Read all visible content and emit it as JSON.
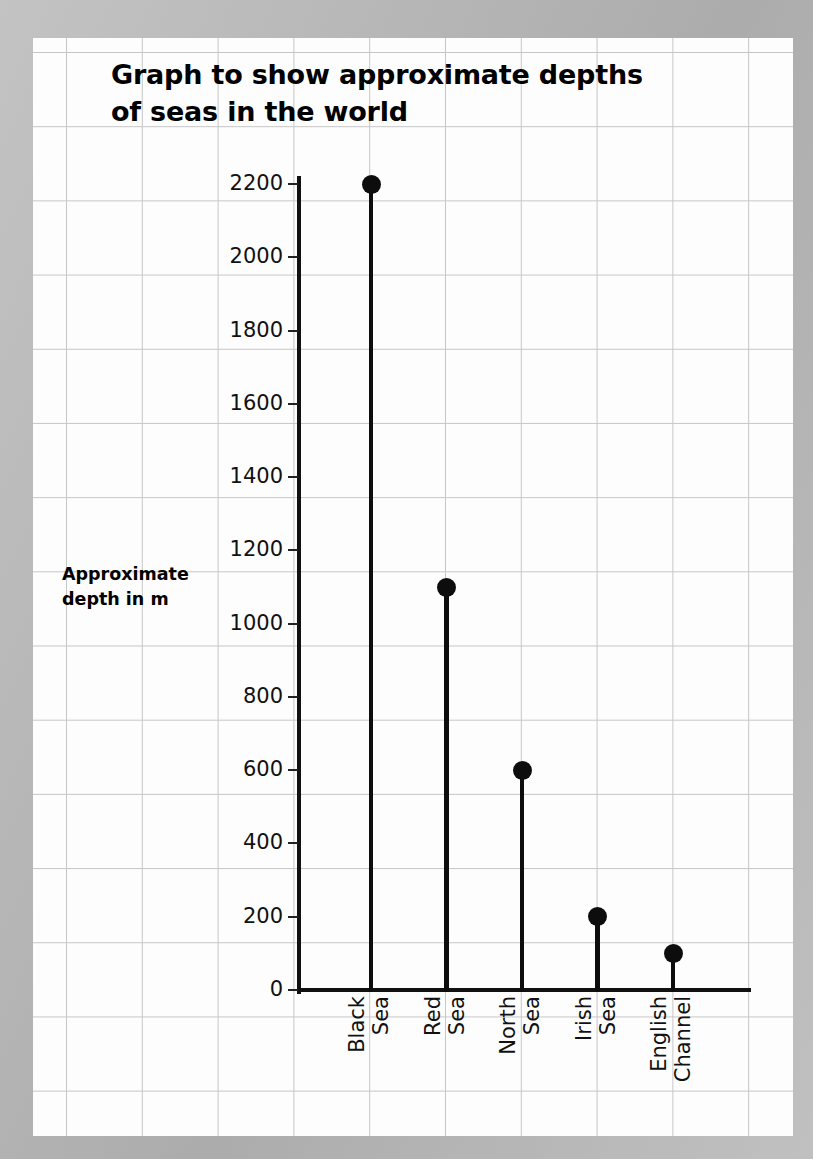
{
  "chart_data": {
    "type": "line",
    "plot_style": "stem-and-dot (lollipop)",
    "title": "Graph to show approximate depths\nof seas in the world",
    "ylabel": "Approximate\ndepth in m",
    "xlabel": "",
    "categories": [
      "Black Sea",
      "Red Sea",
      "North Sea",
      "Irish Sea",
      "English Channel"
    ],
    "category_lines": [
      [
        "Black",
        "Sea"
      ],
      [
        "Red",
        "Sea"
      ],
      [
        "North",
        "Sea"
      ],
      [
        "Irish",
        "Sea"
      ],
      [
        "English",
        "Channel"
      ]
    ],
    "values": [
      2200,
      1100,
      600,
      200,
      100
    ],
    "units": "m",
    "ylim": [
      0,
      2200
    ],
    "ytick_step": 200,
    "yticks": [
      0,
      200,
      400,
      600,
      800,
      1000,
      1200,
      1400,
      1600,
      1800,
      2000,
      2200
    ],
    "ytick_labels": [
      "0",
      "200",
      "400",
      "600",
      "800",
      "1000",
      "1200",
      "1400",
      "1600",
      "1800",
      "2000",
      "2200"
    ],
    "grid": "square graph paper background",
    "legend": "none",
    "marker_color": "#0d0d0d",
    "axis_color": "#111111",
    "gridline_color": "#c6c6c6",
    "paper_color": "#fdfdfd",
    "border_color": "#b9b9b9"
  }
}
